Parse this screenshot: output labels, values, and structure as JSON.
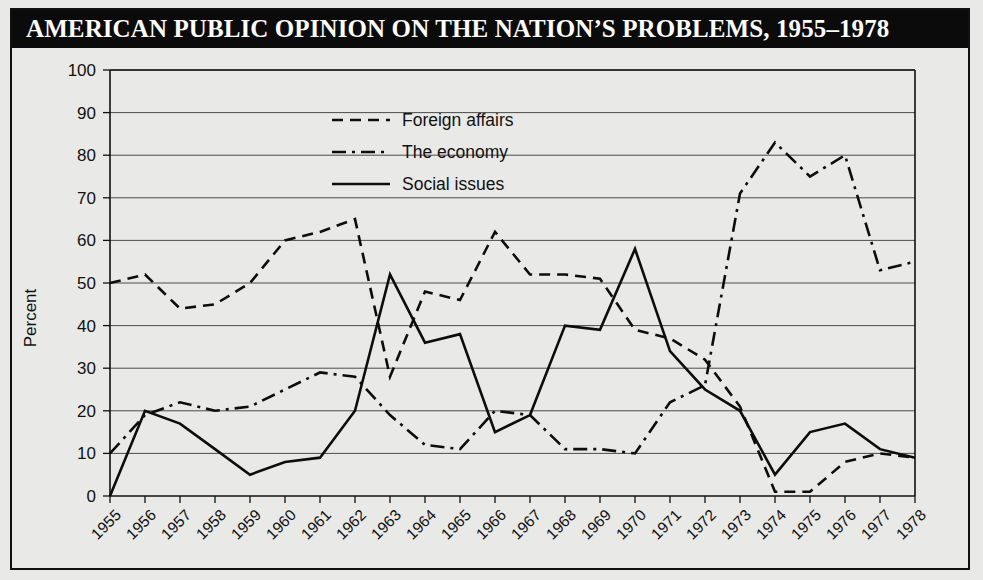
{
  "figure": {
    "title": "AMERICAN PUBLIC OPINION ON THE NATION’S PROBLEMS, 1955–1978"
  },
  "chart_data": {
    "type": "line",
    "title": "AMERICAN PUBLIC OPINION ON THE NATION’S PROBLEMS, 1955–1978",
    "xlabel": "",
    "ylabel": "Percent",
    "ylim": [
      0,
      100
    ],
    "ytick_step": 10,
    "yticks": [
      "0",
      "10",
      "20",
      "30",
      "40",
      "50",
      "60",
      "70",
      "80",
      "90",
      "100"
    ],
    "grid": "horizontal",
    "legend_position": "upper-center-left",
    "categories": [
      "1955",
      "1956",
      "1957",
      "1958",
      "1959",
      "1960",
      "1961",
      "1962",
      "1963",
      "1964",
      "1965",
      "1966",
      "1967",
      "1968",
      "1969",
      "1970",
      "1971",
      "1972",
      "1973",
      "1974",
      "1975",
      "1976",
      "1977",
      "1978"
    ],
    "series": [
      {
        "name": "Foreign affairs",
        "style": "dashed",
        "values": [
          50,
          52,
          44,
          45,
          50,
          60,
          62,
          65,
          28,
          48,
          46,
          62,
          52,
          52,
          51,
          39,
          37,
          32,
          21,
          1,
          1,
          8,
          10,
          9
        ]
      },
      {
        "name": "The economy",
        "style": "dash-dot",
        "values": [
          10,
          19,
          22,
          20,
          21,
          25,
          29,
          28,
          19,
          12,
          11,
          20,
          19,
          11,
          11,
          10,
          22,
          26,
          71,
          83,
          75,
          80,
          53,
          55
        ]
      },
      {
        "name": "Social issues",
        "style": "solid",
        "values": [
          0,
          20,
          17,
          11,
          5,
          8,
          9,
          20,
          52,
          36,
          38,
          15,
          19,
          40,
          39,
          58,
          34,
          25,
          20,
          5,
          15,
          17,
          11,
          9
        ]
      }
    ]
  },
  "legend": {
    "items": [
      {
        "label": "Foreign affairs",
        "style": "dashed"
      },
      {
        "label": "The economy",
        "style": "dash-dot"
      },
      {
        "label": "Social issues",
        "style": "solid"
      }
    ]
  }
}
